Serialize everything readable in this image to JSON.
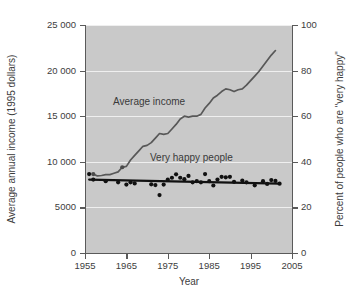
{
  "chart_data": {
    "type": "line",
    "title": "",
    "xlabel": "Year",
    "ylabel_left": "Average annual income (1995 dollars)",
    "ylabel_right": "Percent of people who are \"very happy\"",
    "xlim": [
      1955,
      2005
    ],
    "ylim_left": [
      0,
      25000
    ],
    "ylim_right": [
      0,
      100
    ],
    "xticks": [
      "1955",
      "1965",
      "1975",
      "1985",
      "1995",
      "2005"
    ],
    "xtick_values": [
      1955,
      1965,
      1975,
      1985,
      1995,
      2005
    ],
    "yticks_left": [
      "25 000",
      "20 000",
      "15 000",
      "10 000",
      "5000",
      "0"
    ],
    "ytick_values_left": [
      25000,
      20000,
      15000,
      10000,
      5000,
      0
    ],
    "yticks_right": [
      "100",
      "80",
      "60",
      "40",
      "20",
      "0"
    ],
    "ytick_values_right": [
      100,
      80,
      60,
      40,
      20,
      0
    ],
    "grid": true,
    "grid_color": "#efefef",
    "plot_background": "#c9c9c9",
    "legend_position": "inline-annotation",
    "series": [
      {
        "name": "Average income",
        "axis": "left",
        "type": "line",
        "color": "#585858",
        "annotation": "Average income",
        "points": [
          [
            1957,
            8650
          ],
          [
            1958,
            8450
          ],
          [
            1959,
            8500
          ],
          [
            1960,
            8600
          ],
          [
            1961,
            8600
          ],
          [
            1962,
            8750
          ],
          [
            1963,
            8900
          ],
          [
            1964,
            9400
          ],
          [
            1965,
            9500
          ],
          [
            1966,
            10200
          ],
          [
            1967,
            10700
          ],
          [
            1968,
            11200
          ],
          [
            1969,
            11700
          ],
          [
            1970,
            11800
          ],
          [
            1971,
            12100
          ],
          [
            1972,
            12600
          ],
          [
            1973,
            13100
          ],
          [
            1974,
            13000
          ],
          [
            1975,
            13100
          ],
          [
            1976,
            13600
          ],
          [
            1977,
            14100
          ],
          [
            1978,
            14700
          ],
          [
            1979,
            15000
          ],
          [
            1980,
            14900
          ],
          [
            1981,
            15000
          ],
          [
            1982,
            15000
          ],
          [
            1983,
            15200
          ],
          [
            1984,
            15900
          ],
          [
            1985,
            16400
          ],
          [
            1986,
            17000
          ],
          [
            1987,
            17300
          ],
          [
            1988,
            17700
          ],
          [
            1989,
            18000
          ],
          [
            1990,
            17900
          ],
          [
            1991,
            17700
          ],
          [
            1992,
            17900
          ],
          [
            1993,
            18000
          ],
          [
            1994,
            18400
          ],
          [
            1995,
            18900
          ],
          [
            1996,
            19400
          ],
          [
            1997,
            19900
          ],
          [
            1998,
            20500
          ],
          [
            1999,
            21100
          ],
          [
            2000,
            21700
          ],
          [
            2001,
            22200
          ]
        ]
      },
      {
        "name": "Very happy people",
        "axis": "right",
        "type": "scatter-with-trend",
        "color": "#111111",
        "annotation": "Very happy people",
        "trend_line": [
          [
            1956,
            32.2
          ],
          [
            2002,
            30.4
          ]
        ],
        "points": [
          [
            1956,
            34.6
          ],
          [
            1957,
            32.2
          ],
          [
            1960,
            31.5
          ],
          [
            1963,
            31.0
          ],
          [
            1965,
            30.0
          ],
          [
            1966,
            31.0
          ],
          [
            1967,
            30.5
          ],
          [
            1971,
            30.1
          ],
          [
            1972,
            29.8
          ],
          [
            1973,
            25.4
          ],
          [
            1974,
            30.0
          ],
          [
            1975,
            32.2
          ],
          [
            1976,
            33.0
          ],
          [
            1977,
            34.5
          ],
          [
            1978,
            33.0
          ],
          [
            1979,
            32.4
          ],
          [
            1980,
            33.8
          ],
          [
            1981,
            31.0
          ],
          [
            1982,
            31.5
          ],
          [
            1983,
            31.0
          ],
          [
            1984,
            34.6
          ],
          [
            1985,
            31.5
          ],
          [
            1986,
            29.6
          ],
          [
            1987,
            32.2
          ],
          [
            1988,
            33.4
          ],
          [
            1989,
            33.2
          ],
          [
            1990,
            33.4
          ],
          [
            1991,
            31.2
          ],
          [
            1993,
            31.8
          ],
          [
            1994,
            31.0
          ],
          [
            1996,
            29.7
          ],
          [
            1998,
            31.5
          ],
          [
            1999,
            30.3
          ],
          [
            2000,
            32.0
          ],
          [
            2001,
            31.6
          ],
          [
            2002,
            30.4
          ]
        ]
      }
    ]
  }
}
